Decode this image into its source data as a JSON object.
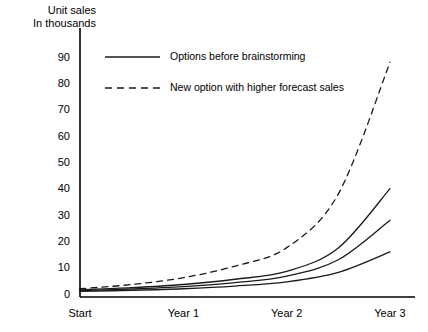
{
  "chart_data": {
    "type": "line",
    "title": "",
    "subtitle": "",
    "ylabel_line1": "Unit sales",
    "ylabel_line2": "In thousands",
    "xlabel": "",
    "ylim": [
      0,
      95
    ],
    "yticks": [
      0,
      10,
      20,
      30,
      40,
      50,
      60,
      70,
      80,
      90
    ],
    "ytick_labels": [
      "0",
      "10",
      "20",
      "30",
      "40",
      "50",
      "60",
      "70",
      "80",
      "90"
    ],
    "xlim": [
      0,
      3
    ],
    "xticks": [
      0,
      1,
      2,
      3
    ],
    "xtick_labels": [
      "Start",
      "Year 1",
      "Year 2",
      "Year 3"
    ],
    "grid": false,
    "legend_position": "upper-left-inside",
    "legend": [
      {
        "label": "Options before brainstorming",
        "style": "solid"
      },
      {
        "label": "New option with higher forecast sales",
        "style": "dashed"
      }
    ],
    "x": [
      0,
      0.5,
      1,
      1.5,
      2,
      2.5,
      3
    ],
    "series": [
      {
        "name": "New option with higher forecast sales",
        "style": "dashed",
        "color": "#1a1a1a",
        "values": [
          2.0,
          3.6,
          6.2,
          10.6,
          17.6,
          38.0,
          88.0
        ]
      },
      {
        "name": "Options before brainstorming (high)",
        "style": "solid",
        "color": "#1a1a1a",
        "values": [
          1.6,
          2.4,
          3.6,
          5.6,
          8.6,
          17.5,
          40.0
        ]
      },
      {
        "name": "Options before brainstorming (mid)",
        "style": "solid",
        "color": "#1a1a1a",
        "values": [
          1.3,
          1.9,
          2.8,
          4.3,
          6.8,
          13.0,
          28.0
        ]
      },
      {
        "name": "Options before brainstorming (low)",
        "style": "solid",
        "color": "#1a1a1a",
        "values": [
          1.0,
          1.4,
          2.0,
          3.0,
          4.6,
          8.2,
          16.0
        ]
      }
    ],
    "colors": {
      "axis": "#000000",
      "line": "#1a1a1a",
      "background": "#ffffff"
    }
  }
}
